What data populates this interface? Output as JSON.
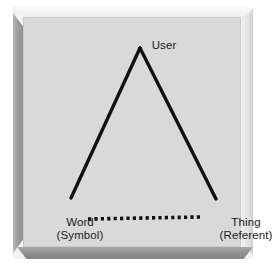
{
  "figure": {
    "kind": "semiotic-triangle",
    "frame_style": "beveled-3d-plaque",
    "panel_color": "#d9d9d9",
    "ink_color": "#111111"
  },
  "diagram": {
    "nodes": [
      {
        "id": "user",
        "primary": "User",
        "secondary": "",
        "position": "apex"
      },
      {
        "id": "word",
        "primary": "Word",
        "secondary": "(Symbol)",
        "position": "bottom-left"
      },
      {
        "id": "thing",
        "primary": "Thing",
        "secondary": "(Referent)",
        "position": "bottom-right"
      }
    ],
    "edges": [
      {
        "id": "user-word",
        "from": "user",
        "to": "word",
        "style": "solid"
      },
      {
        "id": "user-thing",
        "from": "user",
        "to": "thing",
        "style": "solid"
      },
      {
        "id": "word-thing",
        "from": "word",
        "to": "thing",
        "style": "dotted"
      }
    ]
  }
}
